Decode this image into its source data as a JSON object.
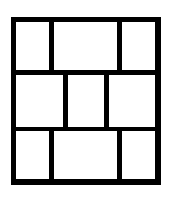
{
  "diagram": {
    "type": "grid-layout",
    "rows": 3,
    "line_color": "#000000",
    "fill_color": "#ffffff",
    "cells": [
      {
        "row": 1,
        "col": 1,
        "left": 16,
        "top": 22,
        "width": 33,
        "height": 48
      },
      {
        "row": 1,
        "col": 2,
        "left": 54,
        "top": 22,
        "width": 63,
        "height": 48
      },
      {
        "row": 1,
        "col": 3,
        "left": 122,
        "top": 22,
        "width": 33,
        "height": 48
      },
      {
        "row": 2,
        "col": 1,
        "left": 16,
        "top": 75,
        "width": 47,
        "height": 52
      },
      {
        "row": 2,
        "col": 2,
        "left": 68,
        "top": 75,
        "width": 36,
        "height": 52
      },
      {
        "row": 2,
        "col": 3,
        "left": 109,
        "top": 75,
        "width": 46,
        "height": 52
      },
      {
        "row": 3,
        "col": 1,
        "left": 16,
        "top": 131,
        "width": 33,
        "height": 48
      },
      {
        "row": 3,
        "col": 2,
        "left": 54,
        "top": 131,
        "width": 63,
        "height": 48
      },
      {
        "row": 3,
        "col": 3,
        "left": 122,
        "top": 131,
        "width": 33,
        "height": 48
      }
    ]
  }
}
